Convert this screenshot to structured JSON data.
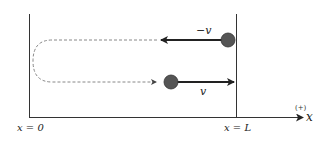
{
  "diagram": {
    "title": "",
    "axis": {
      "label": "x",
      "positive_direction_label": "(+)",
      "origin_label": "x = 0",
      "end_label": "x = L"
    },
    "particles": [
      {
        "id": "upper",
        "velocity_label": "−v",
        "direction": "left"
      },
      {
        "id": "lower",
        "velocity_label": "v",
        "direction": "right"
      }
    ],
    "path": {
      "style": "dashed",
      "description": "return path from upper arrow looping around near x=0 back to lower particle"
    },
    "colors": {
      "line": "#333333",
      "ball": "#555555",
      "dashed": "#888888",
      "background": "#ffffff"
    }
  }
}
